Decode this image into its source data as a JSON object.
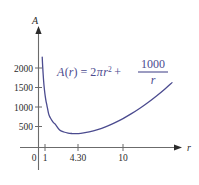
{
  "chart_data": {
    "type": "line",
    "title": "",
    "subtitle": "",
    "xlabel": "r",
    "ylabel": "A",
    "xlim": [
      0,
      16.5
    ],
    "ylim": [
      0,
      2300
    ],
    "grid": false,
    "legend_position": "none",
    "x_ticks": [
      "0",
      "1",
      "4.30",
      "10"
    ],
    "x_tick_values": [
      0,
      1,
      4.3,
      10
    ],
    "y_ticks": [
      "500",
      "1000",
      "1500",
      "2000"
    ],
    "y_tick_values": [
      500,
      1000,
      1500,
      2000
    ],
    "annotations": [
      {
        "name": "function-formula",
        "text": "A(r) = 2πr² + 1000/r",
        "parts": {
          "lhs_fn": "A",
          "lhs_open": "(",
          "lhs_var": "r",
          "lhs_close": ")",
          "equals": "=",
          "coefficient": "2",
          "pi": "π",
          "var": "r",
          "exponent": "2",
          "plus": "+",
          "fraction_numerator": "1000",
          "fraction_denominator": "r"
        }
      }
    ],
    "series": [
      {
        "name": "A(r)",
        "color": "#4b4b8f",
        "formula": "A(r) = 2*pi*r^2 + 1000/r",
        "minimum": {
          "x": 4.3,
          "y": 348
        },
        "x": [
          0.44,
          0.5,
          0.6,
          0.7,
          0.8,
          0.9,
          1.0,
          1.2,
          1.4,
          1.6,
          1.8,
          2.0,
          2.5,
          3.0,
          3.5,
          4.0,
          4.3,
          5.0,
          6.0,
          7.0,
          8.0,
          9.0,
          10.0,
          11.0,
          12.0,
          13.0,
          14.0,
          15.0,
          15.8
        ],
        "y": [
          2275,
          2016,
          1693,
          1459,
          1285,
          1154,
          1056,
          847,
          747,
          676,
          620,
          581,
          439,
          390,
          363,
          351,
          348,
          357,
          393,
          450,
          527,
          620,
          728,
          851,
          988,
          1139,
          1303,
          1480,
          1632
        ]
      }
    ]
  },
  "chart": {
    "axis_color": "#6b6b6b",
    "curve_color": "#4b4b8f",
    "text_color": "#2b2b2b",
    "background": "#ffffff"
  }
}
